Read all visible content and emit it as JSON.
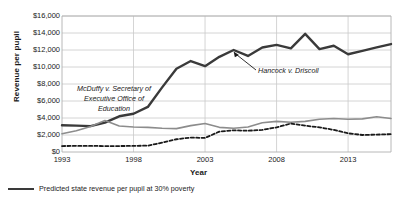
{
  "chart_data": {
    "type": "line",
    "title": "",
    "xlabel": "Year",
    "ylabel": "Revenue per pupil",
    "xlim": [
      1993,
      2016
    ],
    "ylim": [
      0,
      16000
    ],
    "grid": true,
    "y_ticks": [
      0,
      2000,
      4000,
      6000,
      8000,
      10000,
      12000,
      14000,
      16000
    ],
    "y_tick_labels": [
      "$0",
      "$2,000",
      "$4,000",
      "$6,000",
      "$8,000",
      "$10,000",
      "$12,000",
      "$14,000",
      "$16,000"
    ],
    "x_ticks": [
      1993,
      1998,
      2003,
      2008,
      2013
    ],
    "x_tick_labels": [
      "1993",
      "1998",
      "2003",
      "2008",
      "2013"
    ],
    "legend_position": "below-left",
    "x": [
      1993,
      1994,
      1995,
      1996,
      1997,
      1998,
      1999,
      2000,
      2001,
      2002,
      2003,
      2004,
      2005,
      2006,
      2007,
      2008,
      2009,
      2010,
      2011,
      2012,
      2013,
      2014,
      2015,
      2016
    ],
    "series": [
      {
        "name": "Actual state revenue per pupil",
        "style": "solid",
        "color": "#3a3a3a",
        "width": 2.4,
        "values": [
          3150,
          3100,
          3050,
          3450,
          4200,
          4500,
          5300,
          7600,
          9800,
          10700,
          10100,
          11200,
          12000,
          11300,
          12300,
          12600,
          12200,
          13900,
          12100,
          12500,
          11500,
          11900,
          12300,
          12700
        ]
      },
      {
        "name": "Predicted state revenue per pupil at 30% poverty",
        "style": "solid",
        "color": "#8c8c8c",
        "width": 1.6,
        "values": [
          2150,
          2500,
          3000,
          3700,
          3050,
          2950,
          2900,
          2800,
          2750,
          3100,
          3350,
          2900,
          2800,
          2950,
          3450,
          3600,
          3500,
          3600,
          3850,
          3950,
          3850,
          3900,
          4150,
          3950
        ]
      },
      {
        "name": "Predicted state revenue per pupil at 0% poverty",
        "style": "dashed",
        "color": "#1a1a1a",
        "width": 1.8,
        "values": [
          700,
          720,
          720,
          700,
          700,
          720,
          750,
          1100,
          1500,
          1700,
          1650,
          2400,
          2550,
          2500,
          2600,
          2900,
          3350,
          3100,
          2900,
          2600,
          2200,
          2000,
          2050,
          2100
        ]
      }
    ],
    "annotations": [
      {
        "id": "mcduffy",
        "text": "McDuffy v. Secretary of\nExecutive Office of\nEducation",
        "style": "italic",
        "has_arrow": false
      },
      {
        "id": "hancock",
        "text": "Hancock v. Driscoll",
        "style": "italic",
        "has_arrow": true,
        "arrow_target_year": 2005
      }
    ],
    "legend": [
      {
        "label": "Predicted state revenue per pupil at 30% poverty",
        "style": "solid",
        "color": "#3a3a3a"
      }
    ]
  }
}
